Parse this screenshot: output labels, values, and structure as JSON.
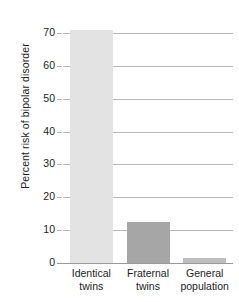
{
  "chart_data": {
    "type": "bar",
    "title": "",
    "subtitle": "",
    "xlabel": "",
    "ylabel": "Percent risk of bipolar disorder",
    "categories": [
      "Identical twins",
      "Fraternal twins",
      "General population"
    ],
    "category_lines": [
      [
        "Identical",
        "twins"
      ],
      [
        "Fraternal",
        "twins"
      ],
      [
        "General",
        "population"
      ]
    ],
    "values": [
      71,
      12.5,
      1.5
    ],
    "ylim": [
      0,
      74
    ],
    "yticks": [
      0,
      10,
      20,
      30,
      40,
      50,
      60,
      70
    ],
    "ytick_labels": [
      "0",
      "10",
      "20",
      "30",
      "40",
      "50",
      "60",
      "70"
    ],
    "grid": true,
    "legend": "none",
    "bar_colors": [
      "#e3e3e3",
      "#a6a6a6",
      "#bdbdbd"
    ],
    "gridline_color": "#b9b9b9",
    "axis_color": "#9a9a9a",
    "text_color": "#1d1d1d",
    "background_color": "#ffffff"
  }
}
